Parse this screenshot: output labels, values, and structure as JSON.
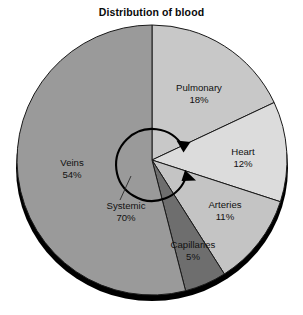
{
  "chart_data": {
    "type": "pie",
    "title": "Distribution of blood",
    "xlabel": "",
    "ylabel": "",
    "categories": [
      "Pulmonary",
      "Heart",
      "Arteries",
      "Capillaries",
      "Veins"
    ],
    "values": [
      18,
      12,
      11,
      5,
      54
    ],
    "value_suffix": "%",
    "start_angle_deg": 0,
    "direction": "clockwise",
    "legend": "none",
    "grid": false,
    "slices": [
      {
        "label": "Pulmonary",
        "value": 18,
        "value_text": "18%",
        "color": "#c8c8c8"
      },
      {
        "label": "Heart",
        "value": 12,
        "value_text": "12%",
        "color": "#dcdcdc"
      },
      {
        "label": "Arteries",
        "value": 11,
        "value_text": "11%",
        "color": "#c4c4c4"
      },
      {
        "label": "Capillaries",
        "value": 5,
        "value_text": "5%",
        "color": "#6e6e6e"
      },
      {
        "label": "Veins",
        "value": 54,
        "value_text": "54%",
        "color": "#9a9a9a"
      }
    ],
    "annotations": [
      {
        "label": "Systemic",
        "value_text": "70%",
        "value": 70,
        "kind": "arc-arrow-callout"
      }
    ],
    "style": {
      "edge_color": "#1a1a1a",
      "depth_color": "#000000",
      "background": "#ffffff",
      "text_color": "#111111"
    }
  }
}
